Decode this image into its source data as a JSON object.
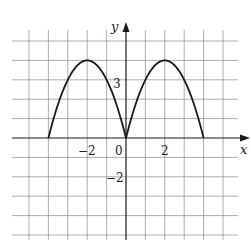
{
  "chart_data": {
    "type": "line",
    "title": "",
    "xlabel": "x",
    "ylabel": "y",
    "xlim": [
      -6.5,
      6.5
    ],
    "ylim": [
      -5.5,
      5.5
    ],
    "grid": true,
    "grid_step": 1,
    "legend": null,
    "tick_labels": {
      "x": [
        {
          "value": -2,
          "label": "−2"
        },
        {
          "value": 0,
          "label": "0"
        },
        {
          "value": 2,
          "label": "2"
        }
      ],
      "y": [
        {
          "value": 3,
          "label": "3"
        },
        {
          "value": -2,
          "label": "−2"
        }
      ]
    },
    "series": [
      {
        "name": "f(x)",
        "description": "Two parabolic arches: zero at x=-4, 0, 4; maxima y=4 at x=-2 and x=2",
        "x": [
          -4,
          -3,
          -2,
          -1,
          0,
          1,
          2,
          3,
          4
        ],
        "y": [
          0,
          3,
          4,
          3,
          0,
          3,
          4,
          3,
          0
        ]
      }
    ]
  },
  "labels": {
    "x_axis": "x",
    "y_axis": "y",
    "origin": "0",
    "x_neg2": "−2",
    "x_pos2": "2",
    "y_pos3": "3",
    "y_neg2": "−2"
  }
}
